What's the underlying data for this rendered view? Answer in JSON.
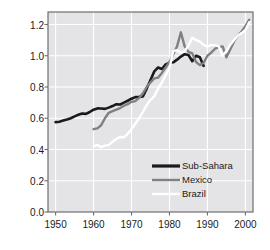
{
  "chart_data": {
    "type": "line",
    "title": "",
    "xlabel": "",
    "ylabel": "Index, 1990=1",
    "xlim": [
      1948,
      2002
    ],
    "ylim": [
      0.0,
      1.28
    ],
    "grid": true,
    "legend_position": "lower-right",
    "xticks": [
      1950,
      1960,
      1970,
      1980,
      1990,
      2000
    ],
    "xtick_labels": [
      "1950",
      "1960",
      "1970",
      "1980",
      "1990",
      "2000"
    ],
    "yticks": [
      0.0,
      0.2,
      0.4,
      0.6,
      0.8,
      1.0,
      1.2
    ],
    "ytick_labels": [
      "0.0",
      "0.2",
      "0.4",
      "0.6",
      "0.8",
      "1.0",
      "1.2"
    ],
    "plot_background": "#e4e4e6",
    "gridline_color": "#ffffff",
    "axis_color": "#6e6e72",
    "series": [
      {
        "name": "Sub-Sahara",
        "color": "#1a1a1a",
        "width": 2.6,
        "x": [
          1950,
          1951,
          1952,
          1953,
          1954,
          1955,
          1956,
          1957,
          1958,
          1959,
          1960,
          1961,
          1962,
          1963,
          1964,
          1965,
          1966,
          1967,
          1968,
          1969,
          1970,
          1971,
          1972,
          1973,
          1974,
          1975,
          1976,
          1977,
          1978,
          1979,
          1980,
          1981,
          1982,
          1983,
          1984,
          1985,
          1986,
          1987,
          1988,
          1989
        ],
        "values": [
          0.575,
          0.578,
          0.585,
          0.592,
          0.6,
          0.612,
          0.622,
          0.63,
          0.628,
          0.64,
          0.655,
          0.663,
          0.662,
          0.66,
          0.668,
          0.678,
          0.69,
          0.688,
          0.7,
          0.712,
          0.725,
          0.735,
          0.737,
          0.74,
          0.79,
          0.845,
          0.9,
          0.925,
          0.915,
          0.945,
          0.955,
          0.958,
          0.975,
          0.995,
          1.01,
          1.005,
          0.965,
          1.0,
          0.99,
          0.935
        ]
      },
      {
        "name": "Mexico",
        "color": "#808084",
        "width": 2.4,
        "x": [
          1960,
          1961,
          1962,
          1963,
          1964,
          1965,
          1966,
          1967,
          1968,
          1969,
          1970,
          1971,
          1972,
          1973,
          1974,
          1975,
          1976,
          1977,
          1978,
          1979,
          1980,
          1981,
          1982,
          1983,
          1984,
          1985,
          1986,
          1987,
          1988,
          1989,
          1990,
          1991,
          1992,
          1993,
          1994,
          1995,
          1996,
          1997,
          1998,
          1999,
          2000,
          2001
        ],
        "values": [
          0.53,
          0.535,
          0.555,
          0.6,
          0.635,
          0.645,
          0.655,
          0.665,
          0.68,
          0.69,
          0.705,
          0.71,
          0.73,
          0.76,
          0.8,
          0.83,
          0.855,
          0.86,
          0.89,
          0.925,
          0.96,
          1.01,
          1.06,
          1.15,
          1.06,
          1.025,
          1.015,
          0.96,
          0.94,
          0.955,
          1.0,
          1.02,
          1.045,
          1.055,
          1.06,
          0.99,
          1.04,
          1.09,
          1.13,
          1.155,
          1.19,
          1.23
        ]
      },
      {
        "name": "Brazil",
        "color": "#ffffff",
        "width": 2.4,
        "x": [
          1960,
          1961,
          1962,
          1963,
          1964,
          1965,
          1966,
          1967,
          1968,
          1969,
          1970,
          1971,
          1972,
          1973,
          1974,
          1975,
          1976,
          1977,
          1978,
          1979,
          1980,
          1981,
          1982,
          1983,
          1984,
          1985,
          1986,
          1987,
          1988,
          1989,
          1990,
          1991,
          1992,
          1993,
          1994,
          1995,
          1996,
          1997,
          1998,
          1999,
          2000,
          2001
        ],
        "values": [
          0.42,
          0.43,
          0.415,
          0.425,
          0.428,
          0.45,
          0.468,
          0.48,
          0.478,
          0.5,
          0.53,
          0.565,
          0.6,
          0.64,
          0.685,
          0.718,
          0.74,
          0.79,
          0.83,
          0.875,
          0.92,
          1.03,
          1.035,
          1.02,
          1.03,
          1.065,
          1.115,
          1.1,
          1.09,
          1.07,
          1.06,
          1.068,
          1.068,
          1.06,
          1.0,
          1.03,
          1.07,
          1.1,
          1.13,
          1.145,
          1.165,
          1.215
        ]
      }
    ]
  },
  "legend": {
    "entries": [
      {
        "label": "Sub-Sahara",
        "color": "#1a1a1a"
      },
      {
        "label": "Mexico",
        "color": "#808084"
      },
      {
        "label": "Brazil",
        "color": "#ffffff"
      }
    ]
  }
}
